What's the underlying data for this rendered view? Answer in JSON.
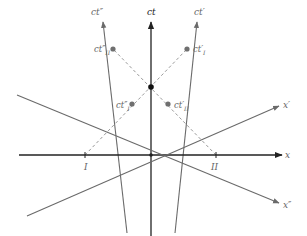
{
  "diagram": {
    "type": "spacetime-diagram",
    "colors": {
      "axis_main": "#222222",
      "axis_secondary": "#6a6a6a",
      "dashed": "#9a9a9a",
      "dot_gray": "#6f6f6f",
      "dot_black": "#111111",
      "label": "#666666"
    },
    "origin": [
      151,
      155
    ],
    "axes": {
      "ct": {
        "label": "ct",
        "from": [
          151,
          236
        ],
        "to": [
          151,
          22
        ],
        "label_pos": [
          147,
          15
        ]
      },
      "ct_double_prime": {
        "label": "ct″",
        "from": [
          127,
          233
        ],
        "to": [
          103,
          22
        ],
        "label_pos": [
          91,
          15
        ]
      },
      "ct_prime": {
        "label": "ct′",
        "from": [
          175,
          233
        ],
        "to": [
          197,
          22
        ],
        "label_pos": [
          194,
          15
        ]
      },
      "x": {
        "label": "x",
        "from": [
          19,
          155
        ],
        "to": [
          282,
          155
        ],
        "label_pos": [
          285,
          158
        ]
      },
      "x_prime": {
        "label": "x′",
        "from": [
          27,
          216
        ],
        "to": [
          279,
          106
        ],
        "label_pos": [
          283,
          108
        ]
      },
      "x_double_prime": {
        "label": "x″",
        "from": [
          17,
          95
        ],
        "to": [
          279,
          203
        ],
        "label_pos": [
          283,
          208
        ]
      }
    },
    "events": [
      {
        "id": "ct_double_prime_II",
        "label": "ct″",
        "sub": "II",
        "pos": [
          113,
          49
        ],
        "label_pos": [
          94,
          52
        ],
        "color": "gray"
      },
      {
        "id": "ct_prime_I",
        "label": "ct′",
        "sub": "I",
        "pos": [
          187,
          49
        ],
        "label_pos": [
          193,
          52
        ],
        "color": "gray"
      },
      {
        "id": "center_event",
        "label": "",
        "sub": "",
        "pos": [
          151,
          87
        ],
        "color": "black"
      },
      {
        "id": "ct_double_prime_I",
        "label": "ct″",
        "sub": "I",
        "pos": [
          132,
          104
        ],
        "label_pos": [
          116,
          108
        ],
        "color": "gray"
      },
      {
        "id": "ct_prime_II",
        "label": "ct′",
        "sub": "II",
        "pos": [
          168,
          104
        ],
        "label_pos": [
          174,
          108
        ],
        "color": "gray"
      }
    ],
    "ticks": [
      {
        "label": "I",
        "pos": [
          85,
          155
        ],
        "label_pos": [
          84,
          170
        ]
      },
      {
        "label": "II",
        "pos": [
          216,
          155
        ],
        "label_pos": [
          211,
          170
        ]
      }
    ],
    "dashed_lines": [
      {
        "from": [
          85,
          155
        ],
        "to": [
          187,
          49
        ]
      },
      {
        "from": [
          216,
          155
        ],
        "to": [
          113,
          49
        ]
      }
    ]
  }
}
